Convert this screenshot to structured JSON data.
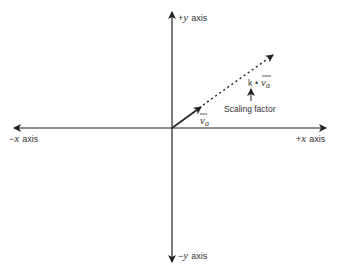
{
  "diagram": {
    "type": "vector-scaling",
    "axes": {
      "pos_y": {
        "sign": "+",
        "var": "y",
        "word": "axis"
      },
      "neg_y": {
        "sign": "−",
        "var": "y",
        "word": "axis"
      },
      "neg_x": {
        "sign": "−",
        "var": "x",
        "word": "axis"
      },
      "pos_x": {
        "sign": "+",
        "var": "x",
        "word": "axis"
      }
    },
    "vector": {
      "symbol": "v",
      "subscript": "a"
    },
    "scaled_vector": {
      "scalar": "k",
      "operator": "•",
      "symbol": "v",
      "subscript": "a"
    },
    "annotation": {
      "label": "Scaling factor"
    },
    "colors": {
      "stroke": "#222222",
      "text": "#333333",
      "background": "#ffffff"
    }
  }
}
